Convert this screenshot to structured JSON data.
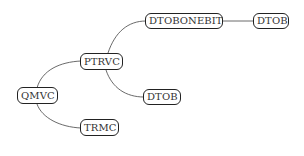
{
  "diagram": {
    "type": "mind-map tree",
    "nodes": [
      {
        "id": "qmvc",
        "label": "QMVC"
      },
      {
        "id": "ptrvc",
        "label": "PTRVC"
      },
      {
        "id": "trmc",
        "label": "TRMC"
      },
      {
        "id": "dtobonebit",
        "label": "DTOBONEBIT"
      },
      {
        "id": "dtob_mid",
        "label": "DTOB"
      },
      {
        "id": "dtob_right",
        "label": "DTOB"
      }
    ],
    "edges": [
      {
        "from": "qmvc",
        "to": "ptrvc"
      },
      {
        "from": "qmvc",
        "to": "trmc"
      },
      {
        "from": "ptrvc",
        "to": "dtobonebit"
      },
      {
        "from": "ptrvc",
        "to": "dtob_mid"
      },
      {
        "from": "dtobonebit",
        "to": "dtob_right"
      }
    ],
    "colors": {
      "stroke": "#222222",
      "edge": "#444444",
      "text": "#333333",
      "background": "#ffffff"
    }
  }
}
